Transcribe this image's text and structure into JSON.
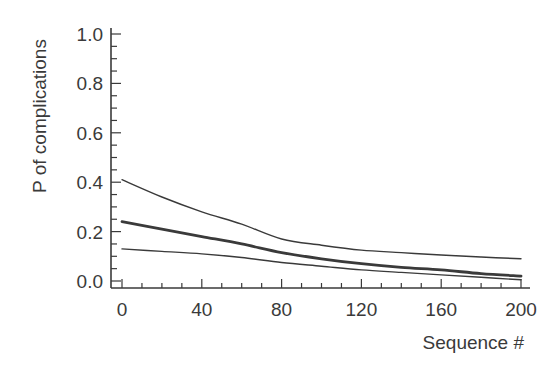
{
  "chart_data": {
    "type": "line",
    "title": "",
    "xlabel": "Sequence #",
    "ylabel": "P of complications",
    "xlim": [
      0,
      200
    ],
    "ylim": [
      0.0,
      1.0
    ],
    "xticks": [
      0,
      40,
      80,
      120,
      160,
      200
    ],
    "xtick_labels": [
      "0",
      "40",
      "80",
      "120",
      "160",
      "200"
    ],
    "yticks": [
      0.0,
      0.2,
      0.4,
      0.6,
      0.8,
      1.0
    ],
    "ytick_labels": [
      "0.0",
      "0.2",
      "0.4",
      "0.6",
      "0.8",
      "1.0"
    ],
    "x_minor_step": 10,
    "y_minor_step": 0.05,
    "grid": false,
    "legend": null,
    "x": [
      0,
      20,
      40,
      60,
      80,
      100,
      120,
      140,
      160,
      180,
      200
    ],
    "series": [
      {
        "name": "Upper confidence bound",
        "style": "thin",
        "values": [
          0.41,
          0.34,
          0.28,
          0.23,
          0.17,
          0.145,
          0.125,
          0.115,
          0.105,
          0.097,
          0.09
        ]
      },
      {
        "name": "Estimate",
        "style": "thick",
        "values": [
          0.24,
          0.21,
          0.18,
          0.15,
          0.115,
          0.09,
          0.07,
          0.055,
          0.045,
          0.03,
          0.02
        ]
      },
      {
        "name": "Lower confidence bound",
        "style": "thin",
        "values": [
          0.13,
          0.12,
          0.11,
          0.095,
          0.075,
          0.06,
          0.045,
          0.035,
          0.025,
          0.015,
          0.005
        ]
      }
    ]
  },
  "colors": {
    "axis": "#3a3a3a",
    "line": "#3a3a3a",
    "background": "#ffffff"
  }
}
